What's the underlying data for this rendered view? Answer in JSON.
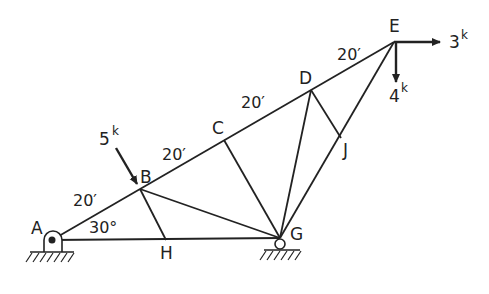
{
  "diagram": {
    "type": "truss",
    "colors": {
      "line": "#222222",
      "background": "#ffffff"
    },
    "joints": {
      "A": {
        "label": "A",
        "x": 52,
        "y": 240
      },
      "B": {
        "label": "B",
        "x": 140,
        "y": 189
      },
      "C": {
        "label": "C",
        "x": 224,
        "y": 140
      },
      "D": {
        "label": "D",
        "x": 311,
        "y": 90
      },
      "E": {
        "label": "E",
        "x": 394,
        "y": 42
      },
      "H": {
        "label": "H",
        "x": 166,
        "y": 240
      },
      "G": {
        "label": "G",
        "x": 280,
        "y": 238
      },
      "J": {
        "label": "J",
        "x": 341,
        "y": 138
      }
    },
    "members": [
      [
        "A",
        "B"
      ],
      [
        "B",
        "C"
      ],
      [
        "C",
        "D"
      ],
      [
        "D",
        "E"
      ],
      [
        "A",
        "H"
      ],
      [
        "H",
        "G"
      ],
      [
        "B",
        "H"
      ],
      [
        "B",
        "G"
      ],
      [
        "C",
        "G"
      ],
      [
        "D",
        "G"
      ],
      [
        "D",
        "J"
      ],
      [
        "E",
        "J"
      ],
      [
        "J",
        "G"
      ]
    ],
    "dimensions": [
      {
        "text": "20′",
        "segment": "A-B"
      },
      {
        "text": "20′",
        "segment": "B-C"
      },
      {
        "text": "20′",
        "segment": "C-D"
      },
      {
        "text": "20′",
        "segment": "D-E"
      }
    ],
    "angle": {
      "text": "30°",
      "at": "A"
    },
    "loads": [
      {
        "value": "5",
        "unit": "k",
        "at": "B",
        "direction": "inclined-down"
      },
      {
        "value": "3",
        "unit": "k",
        "at": "E",
        "direction": "right"
      },
      {
        "value": "4",
        "unit": "k",
        "at": "E",
        "direction": "down"
      }
    ],
    "supports": [
      {
        "at": "A",
        "type": "pin"
      },
      {
        "at": "G",
        "type": "roller"
      }
    ]
  }
}
